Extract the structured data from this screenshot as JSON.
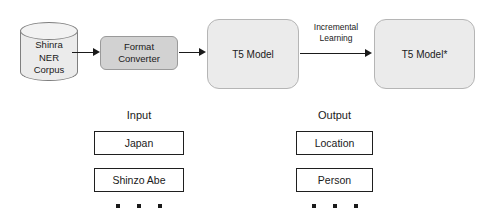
{
  "diagram": {
    "colors": {
      "datastore_fill": "#ebebeb",
      "datastore_stroke": "#7f7f7f",
      "process_fill": "#d2d2d2",
      "process_stroke": "#9a9a9a",
      "model_fill": "#ebebeb",
      "model_stroke": "#b5b5b5",
      "value_box_fill": "#ffffff",
      "value_box_stroke": "#1f1f1f",
      "arrow": "#1a1a1a",
      "text": "#1a1a1a",
      "background": "#ffffff"
    },
    "datastore": {
      "name": "shinra-ner-corpus",
      "lines": [
        "Shinra",
        "NER",
        "Corpus"
      ]
    },
    "process": {
      "name": "format-converter",
      "lines": [
        "Format",
        "Converter"
      ]
    },
    "models": [
      {
        "name": "t5-model",
        "label": "T5 Model"
      },
      {
        "name": "t5-model-star",
        "label": "T5 Model*"
      }
    ],
    "arrows": [
      {
        "name": "corpus-to-converter",
        "label": ""
      },
      {
        "name": "converter-to-model",
        "label": ""
      },
      {
        "name": "model-to-model-star",
        "label": "Incremental Learning",
        "label_lines": [
          "Incremental",
          "Learning"
        ]
      }
    ],
    "examples": {
      "input_heading": "Input",
      "output_heading": "Output",
      "pairs": [
        {
          "input": "Japan",
          "output": "Location"
        },
        {
          "input": "Shinzo Abe",
          "output": "Person"
        }
      ],
      "ellipsis_dots": 3
    }
  }
}
